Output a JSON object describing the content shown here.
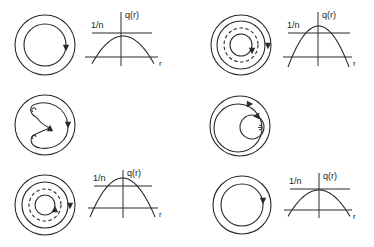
{
  "colors": {
    "stroke": "#2a2a2a",
    "background": "#ffffff"
  },
  "labels": {
    "inverse_n": "1/n",
    "q_of_r": "q(r)",
    "r_axis": "r"
  },
  "panels": [
    {
      "id": "row1-left",
      "description": "nested flux surfaces, single closed orbit, q profile peak below 1/n",
      "circle": {
        "cx": 45,
        "cy": 45,
        "rings": [
          30,
          21
        ],
        "dashed": [],
        "arrows": [
          {
            "x": 66,
            "y": 48,
            "dir": "down"
          }
        ]
      },
      "chart": {
        "x0": 85,
        "x1": 158,
        "axisY": 57,
        "axisX": 121,
        "top": 12,
        "bottom": 66,
        "nLineY": 33,
        "nLineX0": 92,
        "nLineX1": 152,
        "peakY": 36,
        "rootL": 96,
        "rootR": 150,
        "baseY": 68
      }
    },
    {
      "id": "row1-right",
      "description": "nested surfaces with resonant dashed surface, q profile crossing 1/n twice",
      "circle": {
        "cx": 241,
        "cy": 45,
        "rings": [
          30,
          24,
          11
        ],
        "dashed": [
          17
        ],
        "arrows": [
          {
            "x": 252,
            "y": 51,
            "dir": "down"
          },
          {
            "x": 268,
            "y": 46,
            "dir": "down"
          }
        ]
      },
      "chart": {
        "x0": 283,
        "x1": 352,
        "axisY": 57,
        "axisX": 318,
        "top": 12,
        "bottom": 66,
        "nLineY": 33,
        "nLineX0": 288,
        "nLineX1": 350,
        "peakY": 26,
        "rootL": 292,
        "rootR": 345,
        "baseY": 68
      }
    },
    {
      "id": "row2-left",
      "description": "magnetic island structure with hooked field lines",
      "circle": {
        "cx": 45,
        "cy": 125,
        "rings": [
          30
        ],
        "dashed": [],
        "arrows": [
          {
            "x": 68,
            "y": 125,
            "dir": "down"
          },
          {
            "x": 50,
            "y": 128,
            "dir": "up"
          }
        ]
      }
    },
    {
      "id": "row2-right",
      "description": "offset inner surface, reconnected configuration",
      "circle": {
        "cx": 240,
        "cy": 126,
        "rings": [
          30
        ],
        "dashed": [],
        "arrows": [
          {
            "x": 250,
            "y": 104,
            "dir": "right"
          },
          {
            "x": 256,
            "y": 116,
            "dir": "left"
          }
        ]
      }
    },
    {
      "id": "row3-left",
      "description": "nested surfaces with resonant dashed surface, q profile crossing 1/n twice",
      "circle": {
        "cx": 45,
        "cy": 205,
        "rings": [
          30,
          23,
          10
        ],
        "dashed": [
          16
        ],
        "arrows": [
          {
            "x": 55,
            "y": 209,
            "dir": "up"
          },
          {
            "x": 70,
            "y": 206,
            "dir": "down"
          }
        ]
      },
      "chart": {
        "x0": 88,
        "x1": 158,
        "axisY": 208,
        "axisX": 123,
        "top": 170,
        "bottom": 218,
        "nLineY": 186,
        "nLineX0": 94,
        "nLineX1": 152,
        "peakY": 178,
        "rootL": 94,
        "rootR": 151,
        "baseY": 218
      }
    },
    {
      "id": "row3-right",
      "description": "nested flux surfaces, single closed orbit, q profile peak below 1/n",
      "circle": {
        "cx": 242,
        "cy": 205,
        "rings": [
          29,
          21
        ],
        "dashed": [],
        "arrows": [
          {
            "x": 263,
            "y": 201,
            "dir": "down"
          }
        ]
      },
      "chart": {
        "x0": 284,
        "x1": 352,
        "axisY": 210,
        "axisX": 319,
        "top": 173,
        "bottom": 218,
        "nLineY": 189,
        "nLineX0": 290,
        "nLineX1": 350,
        "peakY": 190,
        "rootL": 292,
        "rootR": 346,
        "baseY": 218
      }
    }
  ]
}
